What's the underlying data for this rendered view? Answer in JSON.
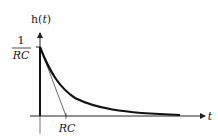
{
  "diagram": {
    "type": "impulse-response-plot",
    "y_axis_label": "h(t)",
    "y_axis_label_parts": {
      "fn": "h(",
      "var": "t",
      "close": ")"
    },
    "x_axis_label": "t",
    "peak_label": {
      "numerator": "1",
      "denominator": "RC"
    },
    "time_constant_label": "RC",
    "curve": "exponential decay h(t) = (1/RC) e^(-t/RC)",
    "tangent_line": "initial-slope tangent intersecting t-axis at RC",
    "colors": {
      "curve": "#111111",
      "axes": "#222222",
      "tangent": "#444444"
    }
  }
}
